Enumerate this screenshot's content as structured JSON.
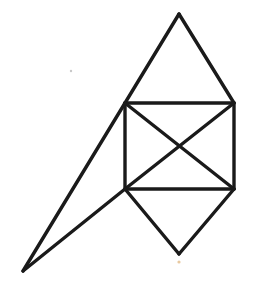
{
  "figure": {
    "stroke_color": "#1a1a1a",
    "background": "#ffffff",
    "points": {
      "top_apex": [
        179,
        14
      ],
      "square_top_left": [
        125,
        103
      ],
      "square_top_right": [
        234,
        103
      ],
      "square_bottom_left": [
        125,
        189
      ],
      "square_bottom_right": [
        234,
        189
      ],
      "center": [
        179,
        147
      ],
      "bottom_apex": [
        179,
        254
      ],
      "far_left": [
        23,
        271
      ]
    },
    "edges": [
      [
        "square_top_left",
        "top_apex"
      ],
      [
        "top_apex",
        "square_top_right"
      ],
      [
        "square_top_left",
        "square_top_right"
      ],
      [
        "square_top_right",
        "square_bottom_right"
      ],
      [
        "square_bottom_right",
        "square_bottom_left"
      ],
      [
        "square_bottom_left",
        "square_top_left"
      ],
      [
        "square_top_left",
        "square_bottom_right"
      ],
      [
        "square_top_right",
        "square_bottom_left"
      ],
      [
        "square_bottom_left",
        "bottom_apex"
      ],
      [
        "bottom_apex",
        "square_bottom_right"
      ],
      [
        "square_top_left",
        "far_left"
      ],
      [
        "far_left",
        "square_bottom_left"
      ]
    ],
    "specks": [
      {
        "at": [
          71,
          71
        ],
        "color": "#c8c8c8",
        "r": 1.2
      },
      {
        "at": [
          179,
          262
        ],
        "color": "#e8c9a0",
        "r": 1.6
      }
    ]
  }
}
